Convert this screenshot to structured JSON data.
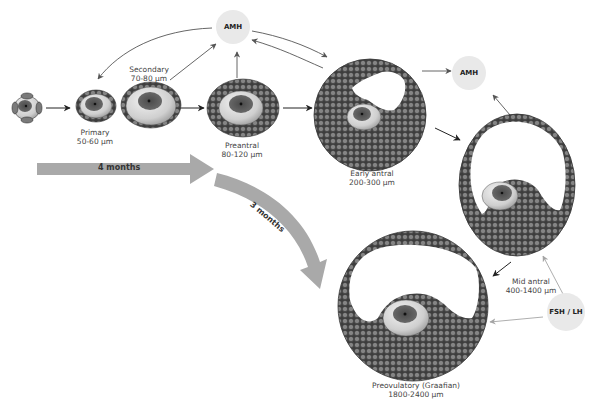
{
  "diagram": {
    "type": "follicle-development-flow",
    "stages": [
      {
        "id": "primordial",
        "name": "",
        "size": ""
      },
      {
        "id": "primary",
        "name": "Primary",
        "size": "50-60 µm"
      },
      {
        "id": "secondary",
        "name": "Secondary",
        "size": "70-80 µm"
      },
      {
        "id": "preantral",
        "name": "Preantral",
        "size": "80-120 µm"
      },
      {
        "id": "early_antral",
        "name": "Early antral",
        "size": "200-300 µm"
      },
      {
        "id": "mid_antral",
        "name": "Mid antral",
        "size": "400-1400 µm"
      },
      {
        "id": "preovulatory",
        "name": "Preovulatory (Graafian)",
        "size": "1800-2400 µm"
      }
    ],
    "hormones": {
      "amh_top": "AMH",
      "amh_right": "AMH",
      "fsh_lh": "FSH / LH"
    },
    "durations": {
      "first": "4 months",
      "second": "3 months"
    },
    "colors": {
      "cell_fill": "#7a7a7a",
      "cell_stroke": "#3a3a3a",
      "oocyte_shell": "#d6d6d6",
      "nucleus": "#5e5e5e",
      "hormone_bg": "#e9e9e9",
      "arrow_dark": "#222222",
      "arrow_grey": "#9a9a9a",
      "timeline_arrow": "#a9a9a9"
    }
  }
}
